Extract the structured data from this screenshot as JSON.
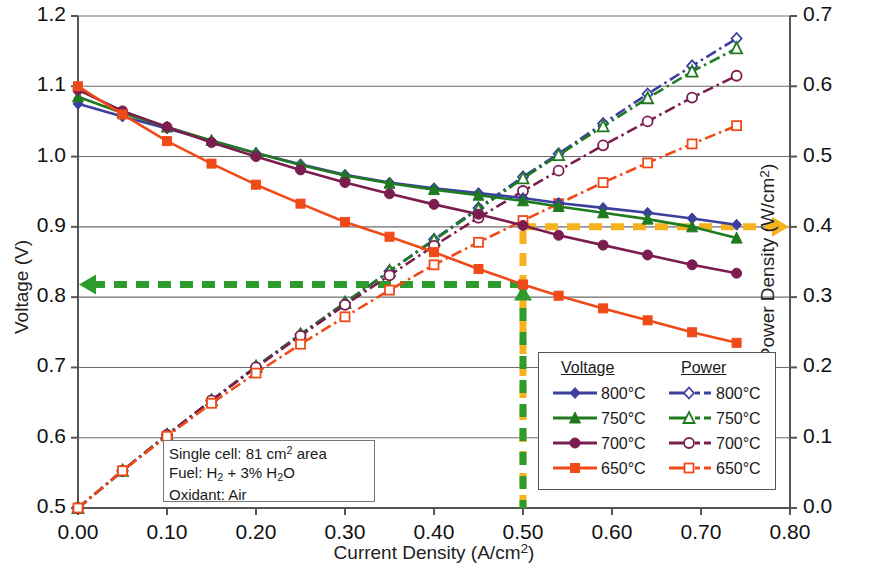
{
  "chart_data": {
    "type": "line",
    "title": "",
    "xlabel": "Current Density (A/cm2)",
    "ylabel": "Voltage (V)",
    "ylabel_right": "Power Density (W/cm2)",
    "xlim": [
      0.0,
      0.8
    ],
    "ylim": [
      0.5,
      1.2
    ],
    "ylim_right": [
      0.0,
      0.7
    ],
    "xticks": [
      "0.00",
      "0.10",
      "0.20",
      "0.30",
      "0.40",
      "0.50",
      "0.60",
      "0.70",
      "0.80"
    ],
    "yticks_left": [
      "0.5",
      "0.6",
      "0.7",
      "0.8",
      "0.9",
      "1.0",
      "1.1",
      "1.2"
    ],
    "yticks_right": [
      "0.0",
      "0.1",
      "0.2",
      "0.3",
      "0.4",
      "0.5",
      "0.6",
      "0.7"
    ],
    "grid": "horizontal",
    "legend_position": "lower-right",
    "series": [
      {
        "name": "800C",
        "group": "Voltage",
        "axis": "left",
        "color": "#3b3f9e",
        "marker": "diamond",
        "filled": true,
        "style": "solid",
        "x": [
          0.0,
          0.05,
          0.1,
          0.15,
          0.2,
          0.25,
          0.3,
          0.35,
          0.4,
          0.45,
          0.5,
          0.54,
          0.59,
          0.64,
          0.69,
          0.74
        ],
        "y": [
          1.075,
          1.057,
          1.04,
          1.022,
          1.005,
          0.989,
          0.974,
          0.963,
          0.955,
          0.948,
          0.941,
          0.934,
          0.927,
          0.92,
          0.912,
          0.903
        ]
      },
      {
        "name": "750C",
        "group": "Voltage",
        "axis": "left",
        "color": "#1f7a20",
        "marker": "triangle",
        "filled": true,
        "style": "solid",
        "x": [
          0.0,
          0.05,
          0.1,
          0.15,
          0.2,
          0.25,
          0.3,
          0.35,
          0.4,
          0.45,
          0.5,
          0.54,
          0.59,
          0.64,
          0.69,
          0.74
        ],
        "y": [
          1.085,
          1.062,
          1.042,
          1.023,
          1.005,
          0.988,
          0.973,
          0.962,
          0.953,
          0.945,
          0.937,
          0.929,
          0.92,
          0.911,
          0.9,
          0.884
        ]
      },
      {
        "name": "700C",
        "group": "Voltage",
        "axis": "left",
        "color": "#7b1d4e",
        "marker": "circle",
        "filled": true,
        "style": "solid",
        "x": [
          0.0,
          0.05,
          0.1,
          0.15,
          0.2,
          0.25,
          0.3,
          0.35,
          0.4,
          0.45,
          0.5,
          0.54,
          0.59,
          0.64,
          0.69,
          0.74
        ],
        "y": [
          1.095,
          1.065,
          1.042,
          1.02,
          1.0,
          0.981,
          0.963,
          0.947,
          0.932,
          0.918,
          0.902,
          0.888,
          0.874,
          0.86,
          0.846,
          0.834
        ]
      },
      {
        "name": "650C",
        "group": "Voltage",
        "axis": "left",
        "color": "#f04a18",
        "marker": "square",
        "filled": true,
        "style": "solid",
        "x": [
          0.0,
          0.05,
          0.1,
          0.15,
          0.2,
          0.25,
          0.3,
          0.35,
          0.4,
          0.45,
          0.5,
          0.54,
          0.59,
          0.64,
          0.69,
          0.74
        ],
        "y": [
          1.1,
          1.06,
          1.022,
          0.99,
          0.96,
          0.933,
          0.907,
          0.886,
          0.864,
          0.84,
          0.818,
          0.802,
          0.784,
          0.767,
          0.75,
          0.735
        ]
      },
      {
        "name": "800C",
        "group": "Power",
        "axis": "right",
        "color": "#3b3f9e",
        "marker": "diamond",
        "filled": false,
        "style": "dashdot",
        "x": [
          0.0,
          0.05,
          0.1,
          0.15,
          0.2,
          0.25,
          0.3,
          0.35,
          0.4,
          0.45,
          0.5,
          0.54,
          0.59,
          0.64,
          0.69,
          0.74
        ],
        "y": [
          0.0,
          0.053,
          0.104,
          0.153,
          0.201,
          0.247,
          0.292,
          0.337,
          0.382,
          0.427,
          0.471,
          0.504,
          0.547,
          0.589,
          0.629,
          0.668
        ]
      },
      {
        "name": "750C",
        "group": "Power",
        "axis": "right",
        "color": "#1f7a20",
        "marker": "triangle",
        "filled": false,
        "style": "dashdot",
        "x": [
          0.0,
          0.05,
          0.1,
          0.15,
          0.2,
          0.25,
          0.3,
          0.35,
          0.4,
          0.45,
          0.5,
          0.54,
          0.59,
          0.64,
          0.69,
          0.74
        ],
        "y": [
          0.0,
          0.053,
          0.104,
          0.153,
          0.201,
          0.247,
          0.292,
          0.337,
          0.381,
          0.425,
          0.469,
          0.502,
          0.543,
          0.583,
          0.621,
          0.654
        ]
      },
      {
        "name": "700C",
        "group": "Power",
        "axis": "right",
        "color": "#7b1d4e",
        "marker": "circle",
        "filled": false,
        "style": "dashdot",
        "x": [
          0.0,
          0.05,
          0.1,
          0.15,
          0.2,
          0.25,
          0.3,
          0.35,
          0.4,
          0.45,
          0.5,
          0.54,
          0.59,
          0.64,
          0.69,
          0.74
        ],
        "y": [
          0.0,
          0.053,
          0.104,
          0.153,
          0.2,
          0.245,
          0.289,
          0.331,
          0.373,
          0.413,
          0.451,
          0.48,
          0.516,
          0.55,
          0.584,
          0.615
        ]
      },
      {
        "name": "650C",
        "group": "Power",
        "axis": "right",
        "color": "#f04a18",
        "marker": "square",
        "filled": false,
        "style": "dashdot",
        "x": [
          0.0,
          0.05,
          0.1,
          0.15,
          0.2,
          0.25,
          0.3,
          0.35,
          0.4,
          0.45,
          0.5,
          0.54,
          0.59,
          0.64,
          0.69,
          0.74
        ],
        "y": [
          0.0,
          0.053,
          0.102,
          0.149,
          0.192,
          0.233,
          0.272,
          0.31,
          0.346,
          0.378,
          0.409,
          0.433,
          0.463,
          0.491,
          0.518,
          0.544
        ]
      }
    ],
    "annotations": {
      "guide_power": {
        "color": "#f5b21c",
        "value_x": 0.5,
        "value_right": 0.4,
        "label": "",
        "arrow": "right"
      },
      "guide_voltage": {
        "color": "#2e9b2e",
        "value_x": 0.5,
        "value_left": 0.818,
        "label": "",
        "arrow": "left"
      }
    }
  },
  "axes": {
    "xlabel_pre": "Current Density (A/cm",
    "xlabel_sup": "2",
    "xlabel_post": ")",
    "ylabel_left": "Voltage (V)",
    "ylabel_right_pre": "Power Density (W/cm",
    "ylabel_right_sup": "2",
    "ylabel_right_post": ")"
  },
  "legend": {
    "header_voltage": "Voltage",
    "header_power": "Power",
    "rows": [
      {
        "label": "800°C"
      },
      {
        "label": "750°C"
      },
      {
        "label": "700°C"
      },
      {
        "label": "650°C"
      }
    ]
  },
  "annotation_box": {
    "line1_pre": "Single cell: 81 cm",
    "line1_sup": "2",
    "line1_post": " area",
    "line2_pre": "Fuel: H",
    "line2_sub1": "2",
    "line2_mid": " + 3% H",
    "line2_sub2": "2",
    "line2_post": "O",
    "line3": "Oxidant: Air"
  }
}
